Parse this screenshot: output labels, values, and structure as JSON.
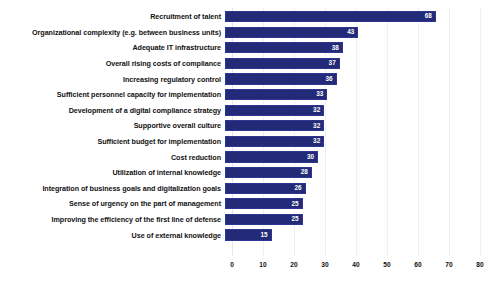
{
  "chart_data": {
    "type": "bar",
    "orientation": "horizontal",
    "title": "",
    "subtitle": "",
    "xlabel": "",
    "ylabel": "",
    "xlim": [
      0,
      80
    ],
    "xticks": [
      0,
      10,
      20,
      30,
      40,
      50,
      60,
      70,
      80
    ],
    "grid": true,
    "legend": false,
    "legend_position": "none",
    "bar_color": "#232a77",
    "value_label_color": "#ffffff",
    "categories": [
      "Recruitment of talent",
      "Organizational complexity (e.g. between business units)",
      "Adequate IT infrastructure",
      "Overall rising costs of compliance",
      "Increasing regulatory control",
      "Sufficient personnel capacity for implementation",
      "Development of a digital compliance strategy",
      "Supportive overall culture",
      "Sufficient budget for implementation",
      "Cost reduction",
      "Utilization of internal knowledge",
      "Integration of business goals and digitalization goals",
      "Sense of urgency on the part of management",
      "Improving the efficiency of the first line of defense",
      "Use of external knowledge"
    ],
    "values": [
      68,
      43,
      38,
      37,
      36,
      33,
      32,
      32,
      32,
      30,
      28,
      26,
      25,
      25,
      15
    ],
    "value_labels": [
      "68",
      "43",
      "38",
      "37",
      "36",
      "33",
      "32",
      "32",
      "32",
      "30",
      "28",
      "26",
      "25",
      "25",
      "15"
    ]
  }
}
